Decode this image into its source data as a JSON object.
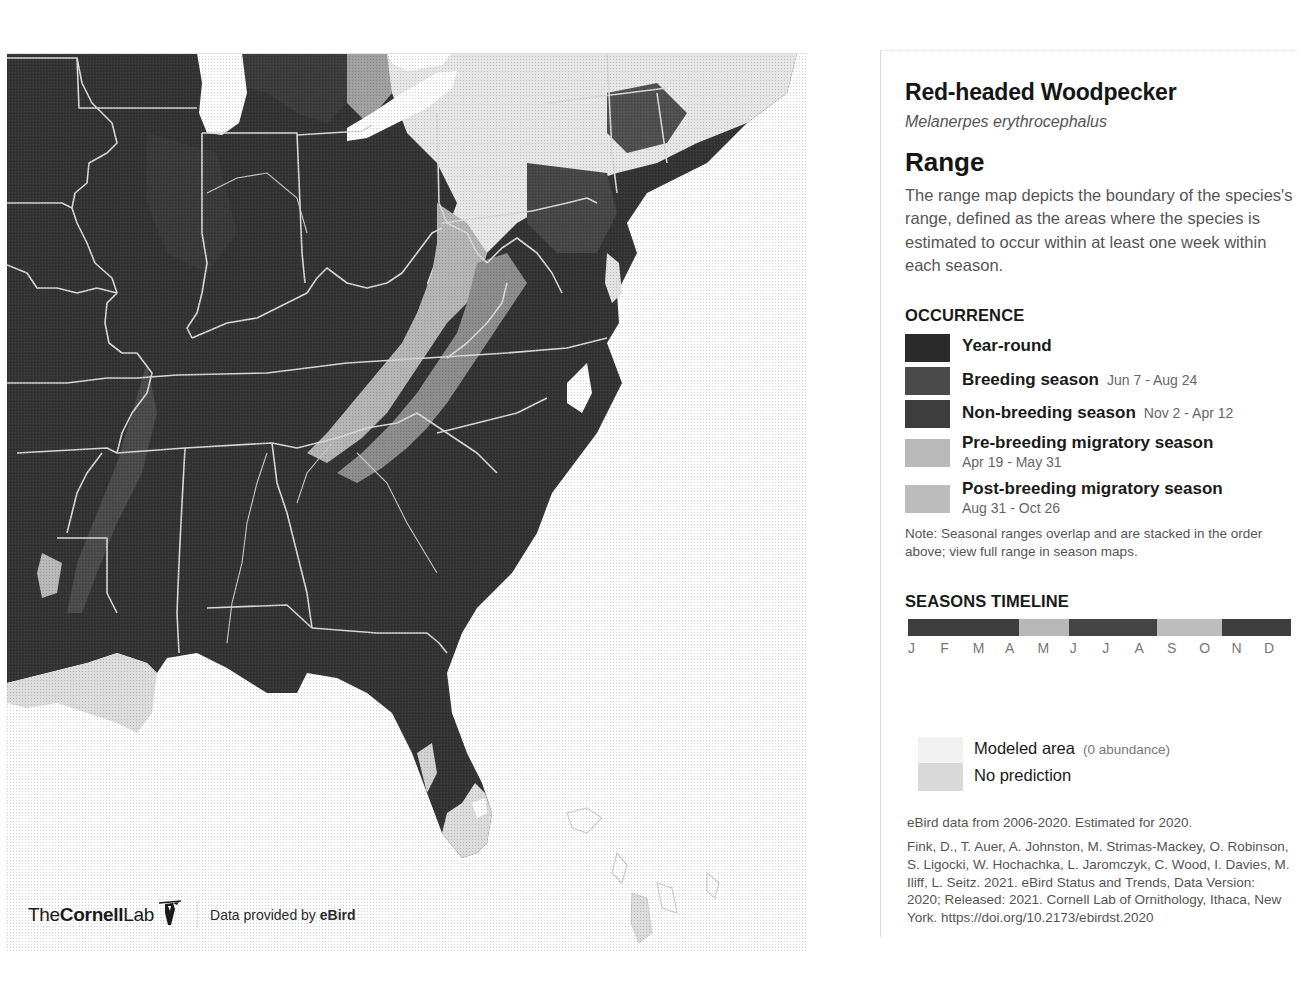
{
  "species": {
    "common_name": "Red-headed Woodpecker",
    "scientific_name": "Melanerpes erythrocephalus"
  },
  "range": {
    "title": "Range",
    "description": "The range map depicts the boundary of the species's range, defined as the areas where the species is estimated to occur within at least one week within each season."
  },
  "occurrence": {
    "heading": "OCCURRENCE",
    "items": [
      {
        "label": "Year-round",
        "dates": "",
        "color": "#2b2b2b",
        "dates_layout": "none"
      },
      {
        "label": "Breeding season",
        "dates": "Jun 7 - Aug 24",
        "color": "#4a4a4a",
        "dates_layout": "inline"
      },
      {
        "label": "Non-breeding season",
        "dates": "Nov 2 - Apr 12",
        "color": "#3d3d3d",
        "dates_layout": "inline"
      },
      {
        "label": "Pre-breeding migratory season",
        "dates": "Apr 19 - May 31",
        "color": "#b9b9b9",
        "dates_layout": "block"
      },
      {
        "label": "Post-breeding migratory season",
        "dates": "Aug 31 - Oct 26",
        "color": "#bcbcbc",
        "dates_layout": "block"
      }
    ],
    "note": "Note: Seasonal ranges overlap and are stacked in the order above; view full range in season maps."
  },
  "timeline": {
    "heading": "SEASONS TIMELINE",
    "months": [
      "J",
      "F",
      "M",
      "A",
      "M",
      "J",
      "J",
      "A",
      "S",
      "O",
      "N",
      "D"
    ],
    "segments": [
      {
        "season": "Non-breeding",
        "start": "Jan 1",
        "end": "Apr 12",
        "color": "#3e3e3e",
        "width_pct": 29
      },
      {
        "season": "Pre-breeding migratory",
        "start": "Apr 19",
        "end": "May 31",
        "color": "#b8b8b8",
        "width_pct": 13
      },
      {
        "season": "Breeding",
        "start": "Jun 7",
        "end": "Aug 24",
        "color": "#444444",
        "width_pct": 23
      },
      {
        "season": "Post-breeding migratory",
        "start": "Aug 31",
        "end": "Oct 26",
        "color": "#bdbdbd",
        "width_pct": 17
      },
      {
        "season": "Non-breeding",
        "start": "Nov 2",
        "end": "Dec 31",
        "color": "#3e3e3e",
        "width_pct": 18
      }
    ]
  },
  "modeled": {
    "modeled_area_label": "Modeled area",
    "modeled_area_note": "(0 abundance)",
    "modeled_area_color": "#f1f1f1",
    "no_prediction_label": "No prediction",
    "no_prediction_color": "#d9d9d9"
  },
  "credits": {
    "data_range": "eBird data from 2006-2020. Estimated for 2020.",
    "citation": "Fink, D., T. Auer, A. Johnston, M. Strimas-Mackey, O. Robinson, S. Ligocki, W. Hochachka, L. Jaromczyk, C. Wood, I. Davies, M. Iliff, L. Seitz. 2021. eBird Status and Trends, Data Version: 2020; Released: 2021. Cornell Lab of Ornithology, Ithaca, New York. https://doi.org/10.2173/ebirdst.2020"
  },
  "footer": {
    "logo_the": "The",
    "logo_cornell": "Cornell",
    "logo_lab": "Lab",
    "data_provided_prefix": "Data provided by ",
    "data_provided_brand": "eBird"
  },
  "map": {
    "region": "Eastern United States",
    "colors": {
      "year_round": "#343434",
      "breeding": "#4c4c4c",
      "non_breeding": "#3f3f3f",
      "migratory": "#9a9a9a",
      "modeled_area": "#e8e8e8",
      "no_prediction": "#d6d6d6",
      "water": "#ffffff",
      "border": "#d8d8d8"
    }
  }
}
